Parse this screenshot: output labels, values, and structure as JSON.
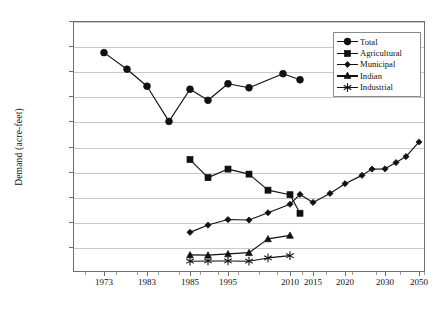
{
  "chart_data": {
    "type": "line",
    "title": "",
    "xlabel": "",
    "ylabel": "Demand (acre-feet)",
    "ylim": [
      0,
      5000000
    ],
    "ytick_labels": [
      "5,000,000",
      "4,500,000",
      "4,000,000",
      "3,500,000",
      "3,000,000",
      "2,500,000",
      "2,000,000",
      "1,500,000",
      "1,000,000",
      "500,000"
    ],
    "ytick_values": [
      5000000,
      4500000,
      4000000,
      3500000,
      3000000,
      2500000,
      2000000,
      1500000,
      1000000,
      500000
    ],
    "xtick_labels": [
      "1973",
      "1983",
      "1985",
      "1995",
      "2010",
      "2015",
      "2020",
      "2030",
      "2050"
    ],
    "grid": "horizontal",
    "legend_position": "top-right",
    "categories": [
      "1973",
      "1980",
      "1983",
      "1990",
      "1985",
      "1991",
      "1995",
      "2000",
      "2005",
      "2012",
      "2015",
      "2018",
      "2020",
      "2023",
      "2030",
      "2035",
      "2040",
      "2050"
    ],
    "series": [
      {
        "name": "Total",
        "marker": "circle",
        "x": [
          1973,
          1979,
          1983,
          1990,
          1985,
          1991,
          1995,
          2000,
          2007,
          2012
        ],
        "values": [
          4370000,
          4040000,
          3700000,
          3000000,
          3640000,
          3420000,
          3750000,
          3670000,
          3950000,
          3830000
        ]
      },
      {
        "name": "Agricultural",
        "marker": "square",
        "x": [
          1985,
          1991,
          1995,
          2000,
          2005,
          2010,
          2012
        ],
        "values": [
          2240000,
          1880000,
          2050000,
          1950000,
          1630000,
          1540000,
          1170000
        ]
      },
      {
        "name": "Municipal",
        "marker": "diamond",
        "x": [
          1985,
          1991,
          1995,
          2000,
          2005,
          2010,
          2012,
          2015,
          2018,
          2020,
          2023,
          2026,
          2030,
          2035,
          2040,
          2050
        ],
        "values": [
          790000,
          935000,
          1045000,
          1035000,
          1180000,
          1350000,
          1545000,
          1385000,
          1565000,
          1760000,
          1925000,
          2050000,
          2055000,
          2180000,
          2300000,
          2590000
        ]
      },
      {
        "name": "Indian",
        "marker": "triangle",
        "x": [
          1985,
          1991,
          1995,
          2000,
          2005,
          2010
        ],
        "values": [
          340000,
          335000,
          360000,
          385000,
          660000,
          730000
        ]
      },
      {
        "name": "Industrial",
        "marker": "star",
        "x": [
          1985,
          1991,
          1995,
          2000,
          2005,
          2010
        ],
        "values": [
          215000,
          220000,
          220000,
          215000,
          280000,
          325000
        ]
      }
    ]
  },
  "legend": {
    "items": [
      {
        "label": "Total",
        "marker": "circle"
      },
      {
        "label": "Agricultural",
        "marker": "square"
      },
      {
        "label": "Municipal",
        "marker": "diamond"
      },
      {
        "label": "Indian",
        "marker": "triangle"
      },
      {
        "label": "Industrial",
        "marker": "star"
      }
    ]
  },
  "colors": {
    "series": "#111111",
    "grid": "#c9c9c9",
    "axis": "#6e6e6e"
  }
}
